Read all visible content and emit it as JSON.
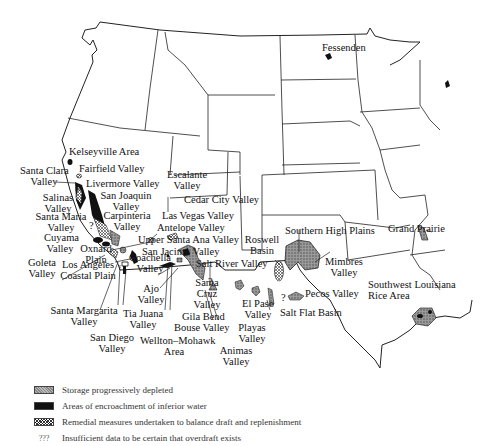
{
  "map": {
    "title": "",
    "labels": {
      "fessenden": "Fessenden",
      "kelseyville": "Kelseyville Area",
      "santa_clara_1": "Santa Clara",
      "santa_clara_2": "Valley",
      "fairfield": "Fairfield Valley",
      "livermore": "Livermore Valley",
      "salinas_1": "Salinas",
      "salinas_2": "Valley",
      "san_joaquin_1": "San Joaquin",
      "san_joaquin_2": "Valley",
      "santa_maria_1": "Santa Maria",
      "santa_maria_2": "Valley",
      "carpinteria_1": "Carpinteria",
      "carpinteria_2": "Valley",
      "escalante_1": "Escalante",
      "escalante_2": "Valley",
      "cedar_city": "Cedar City Valley",
      "las_vegas": "Las Vegas Valley",
      "antelope": "Antelope Valley",
      "cuyama_1": "Cuyama",
      "cuyama_2": "Valley",
      "oxnard_1": "Oxnard",
      "oxnard_2": "Plain",
      "upper_santa_ana": "Upper Santa Ana Valley",
      "san_jacinto": "San Jacinto Valley",
      "goleta_1": "Goleta",
      "goleta_2": "Valley",
      "los_angeles_1": "Los Angeles",
      "los_angeles_2": "Coastal Plain",
      "coachella_1": "Coachella",
      "coachella_2": "Valley",
      "salt_river": "Salt River Valley",
      "ajo_1": "Ajo",
      "ajo_2": "Valley",
      "santa_cruz_1": "Santa",
      "santa_cruz_2": "Cruz",
      "santa_cruz_3": "Valley",
      "santa_margarita_1": "Santa Margarita",
      "santa_margarita_2": "Valley",
      "tia_juana_1": "Tia Juana",
      "tia_juana_2": "Valley",
      "gila_bend": "Gila Bend",
      "bouse": "Bouse Valley",
      "san_diego_1": "San Diego",
      "san_diego_2": "Valley",
      "wellton_1": "Wellton–Mohawk",
      "wellton_2": "Area",
      "playas_1": "Playas",
      "playas_2": "Valley",
      "animas_1": "Animas",
      "animas_2": "Valley",
      "el_paso_1": "El Paso",
      "el_paso_2": "Valley",
      "roswell_1": "Roswell",
      "roswell_2": "Basin",
      "southern_high_plains": "Southern High Plains",
      "mimbres_1": "Mimbres",
      "mimbres_2": "Valley",
      "pecos": "Pecos Valley",
      "salt_flat": "Salt Flat Basin",
      "grand_prairie": "Grand Prairie",
      "sw_louisiana_1": "Southwest Louisiana",
      "sw_louisiana_2": "Rice Area",
      "q1": "?",
      "q2": "?",
      "q3": "?"
    }
  },
  "legend": {
    "items": [
      {
        "symbol": "hatched-gray",
        "label": "Storage progressively depleted"
      },
      {
        "symbol": "solid-black",
        "label": "Areas of encroachment of inferior water"
      },
      {
        "symbol": "crosshatch",
        "label": "Remedial measures undertaken to balance draft and replenishment"
      },
      {
        "symbol": "???",
        "label": "Insufficient data to be certain that overdraft exists"
      }
    ]
  },
  "colors": {
    "ink": "#111111",
    "depleted_fill": "#8a8a8a",
    "background": "#ffffff"
  }
}
